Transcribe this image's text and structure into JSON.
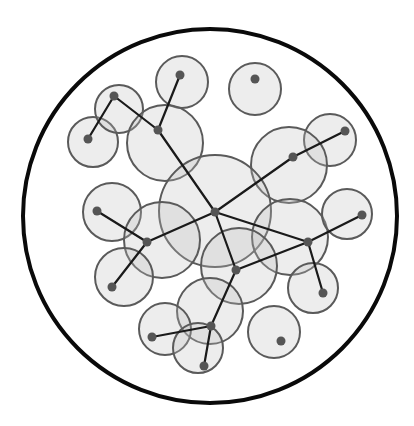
{
  "title": "",
  "colors": {
    "boundary": "#0a0a0a",
    "disk_fill": "#d9d9d9",
    "disk_stroke": "#5a5a5a",
    "edge": "#1a1a1a",
    "node": "#555555"
  },
  "boundary": {
    "shape": "circle"
  },
  "nodes": [
    {
      "id": "n1",
      "label": ""
    },
    {
      "id": "n2",
      "label": ""
    },
    {
      "id": "n3",
      "label": ""
    },
    {
      "id": "n4",
      "label": ""
    },
    {
      "id": "n5",
      "label": ""
    },
    {
      "id": "n6",
      "label": ""
    },
    {
      "id": "n7",
      "label": ""
    },
    {
      "id": "n8",
      "label": ""
    },
    {
      "id": "n9",
      "label": ""
    },
    {
      "id": "n10",
      "label": ""
    },
    {
      "id": "n11",
      "label": ""
    },
    {
      "id": "n12",
      "label": ""
    },
    {
      "id": "n13",
      "label": ""
    },
    {
      "id": "n14",
      "label": ""
    },
    {
      "id": "n15",
      "label": ""
    },
    {
      "id": "n16",
      "label": ""
    },
    {
      "id": "n17",
      "label": ""
    },
    {
      "id": "n18",
      "label": ""
    },
    {
      "id": "n19",
      "label": ""
    },
    {
      "id": "n20",
      "label": ""
    }
  ],
  "edges": [
    [
      "n1",
      "n2"
    ],
    [
      "n2",
      "n4"
    ],
    [
      "n3",
      "n4"
    ],
    [
      "n4",
      "n8"
    ],
    [
      "n6",
      "n7"
    ],
    [
      "n7",
      "n8"
    ],
    [
      "n9",
      "n10"
    ],
    [
      "n10",
      "n8"
    ],
    [
      "n10",
      "n11"
    ],
    [
      "n8",
      "n13"
    ],
    [
      "n8",
      "n12"
    ],
    [
      "n12",
      "n14"
    ],
    [
      "n12",
      "n15"
    ],
    [
      "n12",
      "n13"
    ],
    [
      "n13",
      "n16"
    ],
    [
      "n16",
      "n17"
    ],
    [
      "n16",
      "n18"
    ]
  ],
  "node_count": 20,
  "edge_count": 17
}
